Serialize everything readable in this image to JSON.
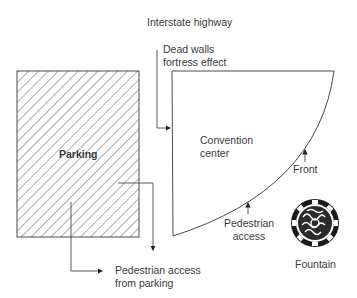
{
  "diagram": {
    "labels": {
      "highway": "Interstate highway",
      "dead_walls_line1": "Dead walls",
      "dead_walls_line2": "fortress effect",
      "parking": "Parking",
      "convention_line1": "Convention",
      "convention_line2": "center",
      "front": "Front",
      "pedestrian_access_line1": "Pedestrian",
      "pedestrian_access_line2": "access",
      "fountain": "Fountain",
      "ped_from_parking_line1": "Pedestrian access",
      "ped_from_parking_line2": "from parking"
    },
    "colors": {
      "line": "#4a4a4a",
      "text": "#3a3a3a",
      "fountain": "#1a1a1a"
    },
    "icons": [
      "arrow-right-icon",
      "arrow-down-icon",
      "arrow-up-icon",
      "fountain-icon"
    ]
  }
}
